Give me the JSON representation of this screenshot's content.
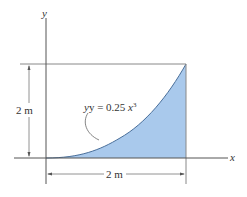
{
  "diagram": {
    "axes": {
      "x_label": "x",
      "y_label": "y"
    },
    "curve": {
      "equation_prefix": "y = 0.25 ",
      "equation_var": "x",
      "equation_exp": "3",
      "function": "y = 0.25x^3",
      "fill_color": "#a9c9ec",
      "stroke_color": "#4a6f9a"
    },
    "dimensions": {
      "height_label": "2 m",
      "width_label": "2 m"
    },
    "colors": {
      "axis": "#555555",
      "dimension": "#777777"
    }
  }
}
